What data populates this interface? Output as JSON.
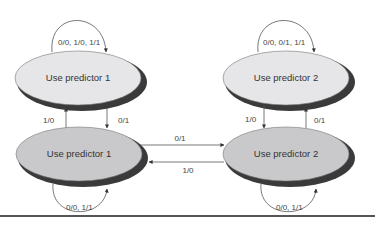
{
  "diagram": {
    "type": "state-machine",
    "states": [
      {
        "id": "s1a",
        "label": "Use predictor 1",
        "position": "top-left",
        "fill": "#e6e6e8"
      },
      {
        "id": "s2a",
        "label": "Use predictor 2",
        "position": "top-right",
        "fill": "#e6e6e8"
      },
      {
        "id": "s1b",
        "label": "Use predictor 1",
        "position": "bottom-left",
        "fill": "#c9c9cb"
      },
      {
        "id": "s2b",
        "label": "Use predictor 2",
        "position": "bottom-right",
        "fill": "#c9c9cb"
      }
    ],
    "transitions": [
      {
        "from": "s1a",
        "to": "s1a",
        "label": "0/0, 1/0, 1/1"
      },
      {
        "from": "s2a",
        "to": "s2a",
        "label": "0/0, 0/1, 1/1"
      },
      {
        "from": "s1b",
        "to": "s1a",
        "label": "1/0"
      },
      {
        "from": "s1a",
        "to": "s1b",
        "label": "0/1"
      },
      {
        "from": "s2a",
        "to": "s2b",
        "label": "1/0"
      },
      {
        "from": "s2b",
        "to": "s2a",
        "label": "0/1"
      },
      {
        "from": "s1b",
        "to": "s2b",
        "label": "0/1"
      },
      {
        "from": "s2b",
        "to": "s1b",
        "label": "1/0"
      },
      {
        "from": "s1b",
        "to": "s1b",
        "label": "0/0, 1/1"
      },
      {
        "from": "s2b",
        "to": "s2b",
        "label": "0/0, 1/1"
      }
    ],
    "colors": {
      "stroke": "#555555",
      "shadow": "#3a3a3a",
      "text": "#333333"
    }
  }
}
